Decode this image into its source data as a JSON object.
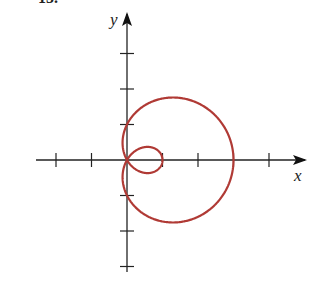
{
  "header": {
    "problem_number_fragment": "15."
  },
  "axes": {
    "x_label": "x",
    "y_label": "y"
  },
  "curve": {
    "equation": "r = 1 + 2 cos θ",
    "description": "Limaçon with inner loop",
    "color": "#b03a35",
    "outer_x_intercept": 3,
    "inner_loop_x_intercept": 1,
    "y_intercepts": [
      1,
      -1
    ]
  },
  "layout": {
    "origin_px": [
      127,
      160
    ],
    "unit_px": 35.5,
    "x_ticks": [
      -2,
      -1,
      1,
      2,
      3,
      4
    ],
    "y_ticks": [
      3,
      2,
      1,
      -1,
      -2,
      -3
    ]
  },
  "chart_data": {
    "type": "line",
    "title": "",
    "xlabel": "x",
    "ylabel": "y",
    "series": [
      {
        "name": "r = 1 + 2cos(θ)",
        "polar": true,
        "theta_range": [
          0,
          6.2832
        ]
      }
    ],
    "xlim": [
      -2.5,
      5
    ],
    "ylim": [
      -3.2,
      4
    ],
    "grid": false
  }
}
